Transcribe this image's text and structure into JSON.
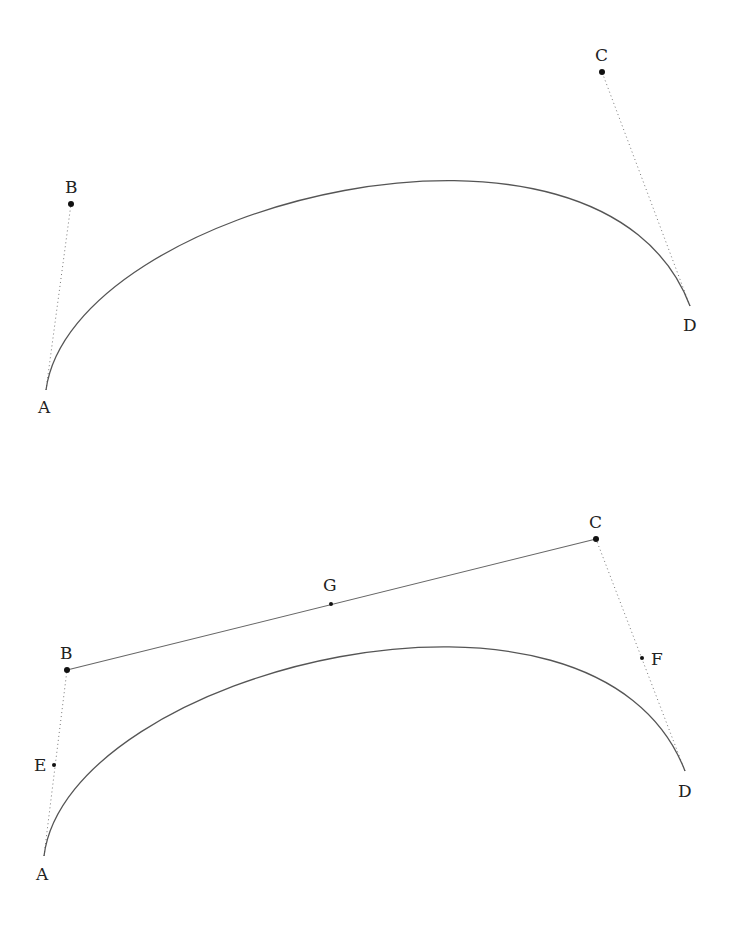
{
  "diagram": {
    "type": "cubic-bezier-construction",
    "panels": [
      {
        "id": "top",
        "points": {
          "A": {
            "label": "A",
            "x": 46,
            "y": 390
          },
          "B": {
            "label": "B",
            "x": 71,
            "y": 204
          },
          "C": {
            "label": "C",
            "x": 602,
            "y": 72
          },
          "D": {
            "label": "D",
            "x": 690,
            "y": 306
          }
        },
        "curve": "A-B-C-D",
        "control_lines": [
          "A-B",
          "D-C"
        ]
      },
      {
        "id": "bottom",
        "points": {
          "A": {
            "label": "A",
            "x": 44,
            "y": 856
          },
          "B": {
            "label": "B",
            "x": 67,
            "y": 670
          },
          "C": {
            "label": "C",
            "x": 596,
            "y": 539
          },
          "D": {
            "label": "D",
            "x": 685,
            "y": 771
          },
          "E": {
            "label": "E",
            "x": 54,
            "y": 765
          },
          "F": {
            "label": "F",
            "x": 642,
            "y": 658
          },
          "G": {
            "label": "G",
            "x": 331,
            "y": 604
          }
        },
        "curve": "A-B-C-D",
        "control_lines": [
          "A-B",
          "D-C"
        ],
        "solid_segments": [
          "B-C"
        ],
        "midpoints": {
          "E": "A-B",
          "F": "C-D",
          "G": "B-C"
        }
      }
    ],
    "colors": {
      "curve": "#555555",
      "point": "#111111",
      "label": "#222222"
    }
  }
}
